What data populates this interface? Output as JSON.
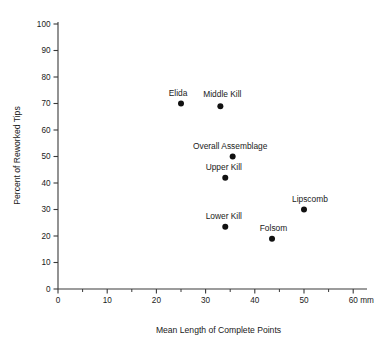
{
  "chart_data": {
    "type": "scatter",
    "title": "",
    "xlabel": "Mean Length of Complete Points",
    "ylabel": "Percent of Reworked Tips",
    "xunit": "mm",
    "xlim": [
      0,
      62
    ],
    "ylim": [
      0,
      103
    ],
    "grid": false,
    "legend": "none",
    "x_ticks_major": [
      0,
      10,
      20,
      30,
      40,
      50,
      60
    ],
    "x_ticks_minor": [
      5,
      15,
      25,
      35,
      45,
      55
    ],
    "y_ticks_major": [
      0,
      10,
      20,
      30,
      40,
      50,
      60,
      70,
      80,
      90,
      100
    ],
    "points": [
      {
        "label": "Elida",
        "x": 25.0,
        "y": 70.0,
        "label_dx": -0.6,
        "label_dy": 8.0,
        "anchor": "middle"
      },
      {
        "label": "Middle Kill",
        "x": 33.0,
        "y": 69.0,
        "label_dx": 0.4,
        "label_dy": 9.0,
        "anchor": "middle"
      },
      {
        "label": "Overall Assemblage",
        "x": 35.5,
        "y": 50.0,
        "label_dx": -0.5,
        "label_dy": 7.5,
        "anchor": "middle"
      },
      {
        "label": "Upper Kill",
        "x": 34.0,
        "y": 42.0,
        "label_dx": -0.3,
        "label_dy": 7.5,
        "anchor": "middle"
      },
      {
        "label": "Lipscomb",
        "x": 50.0,
        "y": 30.0,
        "label_dx": 1.2,
        "label_dy": 7.5,
        "anchor": "middle"
      },
      {
        "label": "Lower Kill",
        "x": 34.0,
        "y": 23.5,
        "label_dx": -0.3,
        "label_dy": 7.5,
        "anchor": "middle"
      },
      {
        "label": "Folsom",
        "x": 43.5,
        "y": 19.0,
        "label_dx": 0.3,
        "label_dy": 7.5,
        "anchor": "middle"
      }
    ]
  },
  "geometry": {
    "origin_x_px": 58,
    "origin_y_px": 289,
    "px_per_x_unit": 4.92,
    "px_per_y_unit": 2.65,
    "x_axis_end_px": 367,
    "y_axis_top_px": 22,
    "marker_radius_px": 3.0,
    "major_tick_len_px": 4.5,
    "minor_tick_len_px": 3.0
  }
}
